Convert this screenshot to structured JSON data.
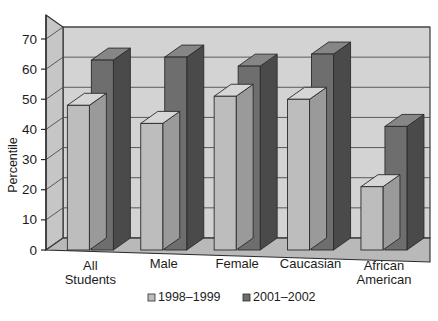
{
  "chart_data": {
    "type": "bar",
    "title": "",
    "subtitle": "",
    "xlabel": "",
    "ylabel": "Percentile",
    "categories": [
      "All Students",
      "Male",
      "Female",
      "Caucasian",
      "African American"
    ],
    "category_lines": [
      [
        "All",
        "Students"
      ],
      [
        "Male"
      ],
      [
        "Female"
      ],
      [
        "Caucasian"
      ],
      [
        "African",
        "American"
      ]
    ],
    "series": [
      {
        "name": "1998–1999",
        "color": "#bdbdbd",
        "values": [
          48,
          42,
          51,
          50,
          21
        ]
      },
      {
        "name": "2001–2002",
        "color": "#6e6e6e",
        "values": [
          63,
          64,
          61,
          65,
          41
        ]
      }
    ],
    "ylim": [
      0,
      70
    ],
    "yticks": [
      0,
      10,
      20,
      30,
      40,
      50,
      60,
      70
    ],
    "ytick_labels": [
      "0",
      "10",
      "20",
      "30",
      "40",
      "50",
      "60",
      "70"
    ],
    "grid": true,
    "grid_axis": "y",
    "legend_position": "bottom",
    "style": "3d-column",
    "colors": {
      "series_1_front": "#bdbdbd",
      "series_1_side": "#9a9a9a",
      "series_1_top": "#d6d6d6",
      "series_2_front": "#6e6e6e",
      "series_2_side": "#4a4a4a",
      "series_2_top": "#868686",
      "wall_back": "#d3d3d3",
      "wall_left": "#c6c6c6",
      "floor": "#b9b9b9",
      "gridline": "#4d4d4d",
      "outline": "#2b2b2b",
      "text": "#1c1c1c",
      "background": "#ffffff"
    }
  },
  "legend": {
    "items": [
      {
        "label": "1998–1999",
        "swatch": "#bdbdbd"
      },
      {
        "label": "2001–2002",
        "swatch": "#6e6e6e"
      }
    ]
  },
  "axes": {
    "y_title": "Percentile"
  }
}
